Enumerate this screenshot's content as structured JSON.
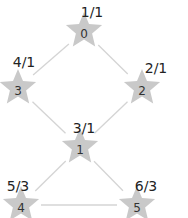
{
  "graph": {
    "nodes": [
      {
        "id": "0",
        "label": "0",
        "annotation": "1/1"
      },
      {
        "id": "1",
        "label": "1",
        "annotation": "3/1"
      },
      {
        "id": "2",
        "label": "2",
        "annotation": "2/1"
      },
      {
        "id": "3",
        "label": "3",
        "annotation": "4/1"
      },
      {
        "id": "4",
        "label": "4",
        "annotation": "5/3"
      },
      {
        "id": "5",
        "label": "5",
        "annotation": "6/3"
      }
    ],
    "edges": [
      {
        "from": "0",
        "to": "3"
      },
      {
        "from": "0",
        "to": "2"
      },
      {
        "from": "3",
        "to": "1"
      },
      {
        "from": "2",
        "to": "1"
      },
      {
        "from": "1",
        "to": "4"
      },
      {
        "from": "1",
        "to": "5"
      },
      {
        "from": "4",
        "to": "5"
      }
    ],
    "node_shape": "star",
    "colors": {
      "node": "#c9c9c9",
      "edge": "#d4d4d4",
      "text": "#222222"
    }
  }
}
